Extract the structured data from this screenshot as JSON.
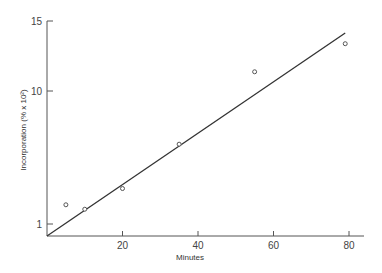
{
  "chart_data": {
    "type": "scatter",
    "title": "",
    "xlabel": "Minutes",
    "ylabel": "Incorporation (% x 10²)",
    "xlim": [
      0,
      84
    ],
    "ylim": [
      0.2,
      15.3
    ],
    "x_ticks": [
      20,
      40,
      60,
      80
    ],
    "x_tick_labels": [
      "20",
      "40",
      "60",
      "80"
    ],
    "y_ticks": [
      1,
      10,
      15
    ],
    "y_tick_labels": [
      "1",
      "10",
      "15"
    ],
    "grid": false,
    "legend": null,
    "series": [
      {
        "name": "Observed",
        "marker": "open-circle",
        "points": [
          {
            "x": 5,
            "y": 2.3
          },
          {
            "x": 10,
            "y": 2.0
          },
          {
            "x": 20,
            "y": 3.4
          },
          {
            "x": 35,
            "y": 6.4
          },
          {
            "x": 55,
            "y": 11.3
          },
          {
            "x": 79,
            "y": 13.2
          }
        ]
      },
      {
        "name": "Fit line",
        "type": "line",
        "points": [
          {
            "x": 0,
            "y": 0.2
          },
          {
            "x": 79,
            "y": 13.9
          }
        ]
      }
    ]
  },
  "colors": {
    "ink": "#333333",
    "marker": "#555555",
    "background": "#ffffff"
  }
}
